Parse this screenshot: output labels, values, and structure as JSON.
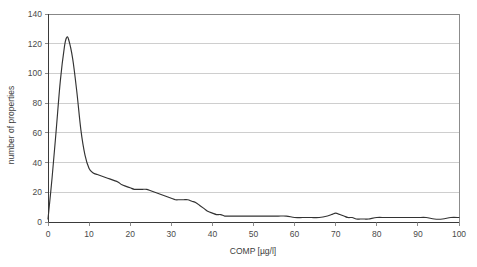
{
  "chart_data": {
    "type": "line",
    "title": "",
    "xlabel": "COMP [µg/l]",
    "ylabel": "number of properties",
    "xlim": [
      0,
      100
    ],
    "ylim": [
      0,
      140
    ],
    "grid": true,
    "grid_axis": "y",
    "legend": "none",
    "xticks": [
      0,
      10,
      20,
      30,
      40,
      50,
      60,
      70,
      80,
      90,
      100
    ],
    "xtick_labels": [
      "0",
      "10",
      "20",
      "30",
      "40",
      "50",
      "60",
      "70",
      "80",
      "90",
      "100"
    ],
    "yticks": [
      0,
      20,
      40,
      60,
      80,
      100,
      120,
      140
    ],
    "ytick_labels": [
      "0",
      "20",
      "40",
      "60",
      "80",
      "100",
      "120",
      "140"
    ],
    "series": [
      {
        "name": "number of properties",
        "color": "#333333",
        "x": [
          0,
          1,
          2,
          3,
          4,
          4.5,
          5,
          6,
          7,
          8,
          9,
          10,
          11,
          12,
          13,
          14,
          15,
          16,
          17,
          18,
          19,
          20,
          21,
          22,
          23,
          24,
          25,
          26,
          27,
          28,
          29,
          30,
          31,
          32,
          33,
          34,
          35,
          36,
          37,
          38,
          39,
          40,
          41,
          42,
          43,
          44,
          45,
          46,
          47,
          48,
          49,
          50,
          52,
          54,
          56,
          58,
          60,
          62,
          64,
          66,
          68,
          69,
          70,
          71,
          72,
          73,
          74,
          75,
          76,
          77,
          78,
          80,
          82,
          84,
          86,
          88,
          90,
          92,
          94,
          96,
          98,
          100
        ],
        "y": [
          2,
          30,
          62,
          95,
          118,
          124,
          123,
          110,
          88,
          62,
          45,
          36,
          33,
          32,
          31,
          30,
          29,
          28,
          27,
          25,
          24,
          23,
          22,
          22,
          22,
          22,
          21,
          20,
          19,
          18,
          17,
          16,
          15,
          15,
          15,
          15,
          14,
          13,
          11,
          9,
          7,
          6,
          5,
          5,
          4,
          4,
          4,
          4,
          4,
          4,
          4,
          4,
          4,
          4,
          4,
          4,
          3,
          3,
          3,
          3,
          4,
          5,
          6,
          5,
          4,
          3,
          3,
          2,
          2,
          2,
          2,
          3,
          3,
          3,
          3,
          3,
          3,
          3,
          2,
          2,
          3,
          3
        ]
      }
    ]
  },
  "axes": {
    "y_axis_title": "number of properties",
    "x_axis_title": "COMP [µg/l]"
  }
}
